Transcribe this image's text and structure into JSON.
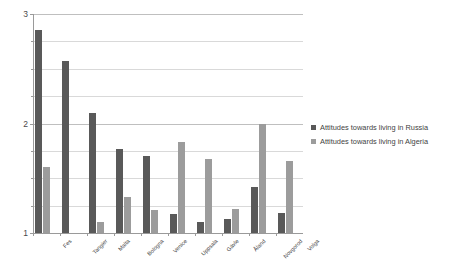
{
  "chart_data": {
    "type": "bar",
    "title": "",
    "xlabel": "",
    "ylabel": "",
    "ylim": [
      1,
      3
    ],
    "yticks": [
      1,
      2,
      3
    ],
    "ytick_labels": [
      "1",
      "2",
      "3"
    ],
    "minor_gridline_step": 0.25,
    "grid": true,
    "legend_position": "right",
    "categories": [
      "Fes",
      "Tangier",
      "Malta",
      "Bologna",
      "Venice",
      "Uppsala",
      "Gävle",
      "Åland",
      "Novgorod",
      "Volga"
    ],
    "series": [
      {
        "name": "Attitudes towards living in Russia",
        "color": "#595959",
        "values": [
          2.85,
          2.57,
          2.1,
          1.77,
          1.7,
          1.17,
          1.1,
          1.13,
          1.42,
          1.18
        ]
      },
      {
        "name": "Attitudes towards living in Algeria",
        "color": "#9c9c9c",
        "values": [
          1.6,
          1.0,
          1.1,
          1.33,
          1.21,
          1.83,
          1.68,
          1.22,
          2.0,
          1.66
        ]
      }
    ]
  },
  "legend": {
    "items": [
      {
        "label": "Attitudes towards living in Russia",
        "color": "#595959"
      },
      {
        "label": "Attitudes towards living in Algeria",
        "color": "#9c9c9c"
      }
    ]
  }
}
